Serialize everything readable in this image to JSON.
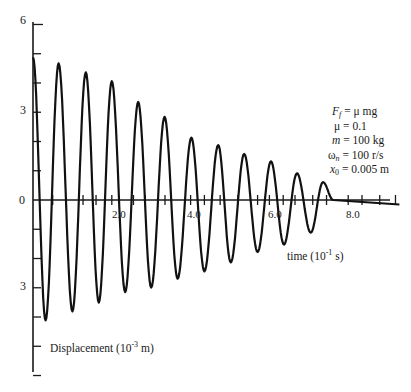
{
  "chart_data": {
    "type": "line",
    "title": "",
    "xlabel": "time (10^-1 s)",
    "ylabel": "Displacement (10^-3 m)",
    "xlim": [
      0,
      9.3
    ],
    "ylim": [
      -6,
      6
    ],
    "x_ticks": [
      {
        "value": 2.0,
        "label": "2.0"
      },
      {
        "value": 4.0,
        "label": "4.0"
      },
      {
        "value": 6.0,
        "label": "6.0"
      },
      {
        "value": 8.0,
        "label": "8.0"
      }
    ],
    "y_ticks": [
      {
        "value": 6,
        "label": "6"
      },
      {
        "value": 3,
        "label": "3"
      },
      {
        "value": 0,
        "label": "0"
      },
      {
        "value": -3,
        "label": "3"
      }
    ],
    "grid": false,
    "legend": null,
    "series": [
      {
        "name": "displacement",
        "extrema": [
          {
            "t": 0.0,
            "x": 4.8
          },
          {
            "t": 0.32,
            "x": -4.05
          },
          {
            "t": 0.65,
            "x": 4.6
          },
          {
            "t": 1.0,
            "x": -3.75
          },
          {
            "t": 1.34,
            "x": 4.3
          },
          {
            "t": 1.67,
            "x": -3.45
          },
          {
            "t": 2.0,
            "x": 4.0
          },
          {
            "t": 2.34,
            "x": -3.1
          },
          {
            "t": 2.67,
            "x": 3.3
          },
          {
            "t": 3.0,
            "x": -2.95
          },
          {
            "t": 3.34,
            "x": 2.8
          },
          {
            "t": 3.67,
            "x": -2.65
          },
          {
            "t": 4.02,
            "x": 2.1
          },
          {
            "t": 4.35,
            "x": -2.4
          },
          {
            "t": 4.7,
            "x": 1.85
          },
          {
            "t": 5.02,
            "x": -2.1
          },
          {
            "t": 5.36,
            "x": 1.55
          },
          {
            "t": 5.7,
            "x": -1.75
          },
          {
            "t": 6.04,
            "x": 1.3
          },
          {
            "t": 6.37,
            "x": -1.5
          },
          {
            "t": 6.7,
            "x": 0.9
          },
          {
            "t": 7.05,
            "x": -1.1
          },
          {
            "t": 7.36,
            "x": 0.6
          },
          {
            "t": 7.62,
            "x": 0.0
          },
          {
            "t": 9.3,
            "x": -0.15
          }
        ]
      }
    ],
    "annotations": [
      "F_f = μ mg",
      "μ = 0.1",
      "m = 100 kg",
      "ω_n = 100 r/s",
      "x_0 = 0.005 m"
    ]
  },
  "labels": {
    "y_top": "6",
    "y_mid_pos": "3",
    "y_zero": "0",
    "y_mid_neg": "3",
    "x_2": "2.0",
    "x_4": "4.0",
    "x_6": "6.0",
    "x_8": "8.0",
    "time_prefix": "time (10",
    "time_exp": "-1",
    "time_suffix": " s)",
    "disp_prefix": "Displacement (10",
    "disp_exp": "-3",
    "disp_suffix": " m)"
  },
  "params": {
    "ff_lhs": "F",
    "ff_sub": "f",
    "ff_rhs": " = μ  mg",
    "mu": "μ = 0.1",
    "m_sym": "m",
    "m_rhs": " = 100 kg",
    "wn_sym": "ω",
    "wn_sub": "n",
    "wn_rhs": " = 100 r/s",
    "x0_sym": "x",
    "x0_sub": "0",
    "x0_rhs": " = 0.005 m"
  }
}
